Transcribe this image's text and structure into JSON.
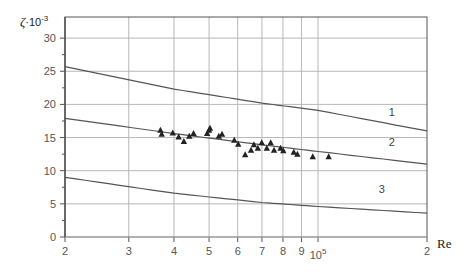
{
  "chart_data": {
    "type": "line",
    "title": "",
    "xlabel": "Re",
    "ylabel": "ζ·10⁻³",
    "x_scale": "log",
    "xlim": [
      20000,
      200000
    ],
    "ylim": [
      0,
      32
    ],
    "grid": true,
    "x_ticks": [
      {
        "value": 20000,
        "label": "2"
      },
      {
        "value": 30000,
        "label": "3"
      },
      {
        "value": 40000,
        "label": "4"
      },
      {
        "value": 50000,
        "label": "5"
      },
      {
        "value": 60000,
        "label": "6"
      },
      {
        "value": 70000,
        "label": "7"
      },
      {
        "value": 80000,
        "label": "8"
      },
      {
        "value": 90000,
        "label": "9"
      },
      {
        "value": 100000,
        "label": "10",
        "sup": "5"
      },
      {
        "value": 200000,
        "label": "2"
      }
    ],
    "y_ticks": [
      0,
      5,
      10,
      15,
      20,
      25,
      30
    ],
    "series": [
      {
        "name": "1",
        "kind": "line",
        "x": [
          20000,
          40000,
          70000,
          100000,
          200000
        ],
        "values": [
          25.7,
          22.3,
          20.2,
          19.1,
          16.0
        ]
      },
      {
        "name": "2",
        "kind": "line",
        "x": [
          20000,
          40000,
          70000,
          100000,
          200000
        ],
        "values": [
          17.9,
          15.6,
          13.9,
          12.9,
          11.0
        ]
      },
      {
        "name": "3",
        "kind": "line",
        "x": [
          20000,
          40000,
          70000,
          100000,
          200000
        ],
        "values": [
          9.0,
          6.6,
          5.2,
          4.6,
          3.6
        ]
      },
      {
        "name": "experimental",
        "kind": "scatter",
        "marker": "triangle",
        "x": [
          36700,
          37000,
          39700,
          41200,
          42600,
          44100,
          45300,
          49400,
          50000,
          50300,
          53200,
          54300,
          58700,
          60200,
          62900,
          65300,
          66500,
          68200,
          69900,
          72200,
          74000,
          75600,
          78800,
          80200,
          85700,
          87700,
          96700,
          107000
        ],
        "values": [
          16.1,
          15.5,
          15.7,
          15.1,
          14.4,
          15.2,
          15.6,
          15.6,
          16.1,
          16.4,
          15.2,
          15.5,
          14.6,
          14.0,
          12.4,
          13.1,
          13.9,
          13.4,
          14.2,
          13.4,
          14.2,
          13.1,
          13.4,
          13.0,
          12.8,
          12.5,
          12.1,
          12.1
        ]
      }
    ],
    "annotations": [
      {
        "text": "1",
        "x": 160000,
        "y": 18.3
      },
      {
        "text": "2",
        "x": 160000,
        "y": 13.8
      },
      {
        "text": "3",
        "x": 150000,
        "y": 6.6
      }
    ]
  },
  "labels": {
    "y_axis_title_main": "ζ",
    "y_axis_title_mult": "·10",
    "y_axis_title_exp": "-3",
    "x_axis_title": "Re"
  },
  "style": {
    "grid_color": "#b8b8b8",
    "axis_color": "#555555",
    "curve_color": "#555555",
    "marker_color": "#222222"
  }
}
